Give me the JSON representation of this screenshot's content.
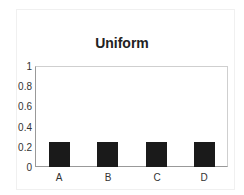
{
  "chart_data": {
    "type": "bar",
    "title": "Uniform",
    "categories": [
      "A",
      "B",
      "C",
      "D"
    ],
    "values": [
      0.25,
      0.25,
      0.25,
      0.25
    ],
    "xlabel": "",
    "ylabel": "",
    "ylim": [
      0,
      1
    ],
    "yticks": [
      "0",
      "0.2",
      "0.4",
      "0.6",
      "0.8",
      "1"
    ],
    "grid": false,
    "legend": null,
    "bar_color": "#1a1a1a"
  }
}
